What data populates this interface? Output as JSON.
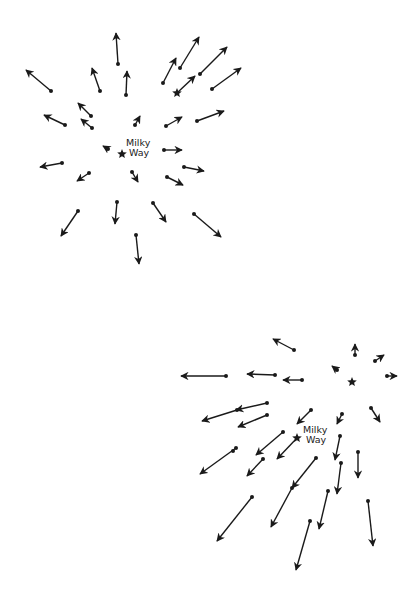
{
  "colors": {
    "ink": "#1a1a1a",
    "background": "#ffffff"
  },
  "panels": [
    {
      "id": "top",
      "description": "Expansion seen from the Milky Way: all galaxies move radially away",
      "label": {
        "line1": "Milky",
        "line2": "Way",
        "x": 126,
        "y": 138
      },
      "milky_way_star": {
        "x": 122,
        "y": 154
      },
      "other_star": {
        "x": 177,
        "y": 93
      },
      "arrows": [
        {
          "x1": 51,
          "y1": 91,
          "x2": 26,
          "y2": 70
        },
        {
          "x1": 118,
          "y1": 64,
          "x2": 116,
          "y2": 33
        },
        {
          "x1": 100,
          "y1": 91,
          "x2": 92,
          "y2": 68
        },
        {
          "x1": 126,
          "y1": 95,
          "x2": 127,
          "y2": 71
        },
        {
          "x1": 163,
          "y1": 83,
          "x2": 176,
          "y2": 58
        },
        {
          "x1": 180,
          "y1": 68,
          "x2": 199,
          "y2": 37
        },
        {
          "x1": 200,
          "y1": 74,
          "x2": 227,
          "y2": 47
        },
        {
          "x1": 212,
          "y1": 89,
          "x2": 241,
          "y2": 68
        },
        {
          "x1": 177,
          "y1": 93,
          "x2": 195,
          "y2": 76,
          "star_tail": true
        },
        {
          "x1": 65,
          "y1": 125,
          "x2": 44,
          "y2": 115
        },
        {
          "x1": 91,
          "y1": 116,
          "x2": 78,
          "y2": 103
        },
        {
          "x1": 92,
          "y1": 128,
          "x2": 81,
          "y2": 119
        },
        {
          "x1": 135,
          "y1": 125,
          "x2": 140,
          "y2": 116
        },
        {
          "x1": 108,
          "y1": 149,
          "x2": 103,
          "y2": 146
        },
        {
          "x1": 166,
          "y1": 126,
          "x2": 182,
          "y2": 117
        },
        {
          "x1": 197,
          "y1": 121,
          "x2": 224,
          "y2": 111
        },
        {
          "x1": 164,
          "y1": 150,
          "x2": 182,
          "y2": 150
        },
        {
          "x1": 184,
          "y1": 167,
          "x2": 204,
          "y2": 171
        },
        {
          "x1": 167,
          "y1": 177,
          "x2": 183,
          "y2": 185
        },
        {
          "x1": 62,
          "y1": 163,
          "x2": 40,
          "y2": 167
        },
        {
          "x1": 89,
          "y1": 173,
          "x2": 77,
          "y2": 181
        },
        {
          "x1": 132,
          "y1": 172,
          "x2": 138,
          "y2": 182
        },
        {
          "x1": 117,
          "y1": 202,
          "x2": 115,
          "y2": 224
        },
        {
          "x1": 78,
          "y1": 211,
          "x2": 61,
          "y2": 236
        },
        {
          "x1": 153,
          "y1": 203,
          "x2": 166,
          "y2": 222
        },
        {
          "x1": 194,
          "y1": 214,
          "x2": 221,
          "y2": 237
        },
        {
          "x1": 136,
          "y1": 235,
          "x2": 139,
          "y2": 264
        }
      ]
    },
    {
      "id": "bottom",
      "description": "Same expansion as seen from another galaxy (the star at upper right)",
      "label": {
        "line1": "Milky",
        "line2": "Way",
        "x": 303,
        "y": 425
      },
      "milky_way_star": {
        "x": 297,
        "y": 438
      },
      "other_star": {
        "x": 352,
        "y": 382
      },
      "arrows": [
        {
          "x1": 294,
          "y1": 350,
          "x2": 273,
          "y2": 339
        },
        {
          "x1": 226,
          "y1": 376,
          "x2": 181,
          "y2": 376
        },
        {
          "x1": 275,
          "y1": 375,
          "x2": 247,
          "y2": 374
        },
        {
          "x1": 302,
          "y1": 380,
          "x2": 283,
          "y2": 380
        },
        {
          "x1": 355,
          "y1": 355,
          "x2": 355,
          "y2": 344
        },
        {
          "x1": 375,
          "y1": 361,
          "x2": 384,
          "y2": 355
        },
        {
          "x1": 337,
          "y1": 370,
          "x2": 332,
          "y2": 366
        },
        {
          "x1": 387,
          "y1": 376,
          "x2": 397,
          "y2": 376
        },
        {
          "x1": 371,
          "y1": 408,
          "x2": 380,
          "y2": 422
        },
        {
          "x1": 342,
          "y1": 414,
          "x2": 337,
          "y2": 424
        },
        {
          "x1": 267,
          "y1": 403,
          "x2": 236,
          "y2": 410
        },
        {
          "x1": 237,
          "y1": 410,
          "x2": 202,
          "y2": 421
        },
        {
          "x1": 267,
          "y1": 415,
          "x2": 238,
          "y2": 427
        },
        {
          "x1": 311,
          "y1": 410,
          "x2": 297,
          "y2": 424
        },
        {
          "x1": 283,
          "y1": 432,
          "x2": 256,
          "y2": 455
        },
        {
          "x1": 297,
          "y1": 438,
          "x2": 277,
          "y2": 459,
          "star_tail": true
        },
        {
          "x1": 236,
          "y1": 448,
          "x2": 200,
          "y2": 474
        },
        {
          "x1": 233,
          "y1": 451,
          "x2": 233,
          "y2": 451,
          "dot_only": true
        },
        {
          "x1": 263,
          "y1": 459,
          "x2": 247,
          "y2": 476
        },
        {
          "x1": 340,
          "y1": 436,
          "x2": 335,
          "y2": 460
        },
        {
          "x1": 358,
          "y1": 452,
          "x2": 358,
          "y2": 478
        },
        {
          "x1": 341,
          "y1": 463,
          "x2": 337,
          "y2": 494
        },
        {
          "x1": 316,
          "y1": 458,
          "x2": 292,
          "y2": 488
        },
        {
          "x1": 292,
          "y1": 488,
          "x2": 271,
          "y2": 527
        },
        {
          "x1": 252,
          "y1": 497,
          "x2": 217,
          "y2": 541
        },
        {
          "x1": 328,
          "y1": 491,
          "x2": 319,
          "y2": 529
        },
        {
          "x1": 310,
          "y1": 521,
          "x2": 296,
          "y2": 570
        },
        {
          "x1": 368,
          "y1": 501,
          "x2": 373,
          "y2": 546
        }
      ]
    }
  ]
}
